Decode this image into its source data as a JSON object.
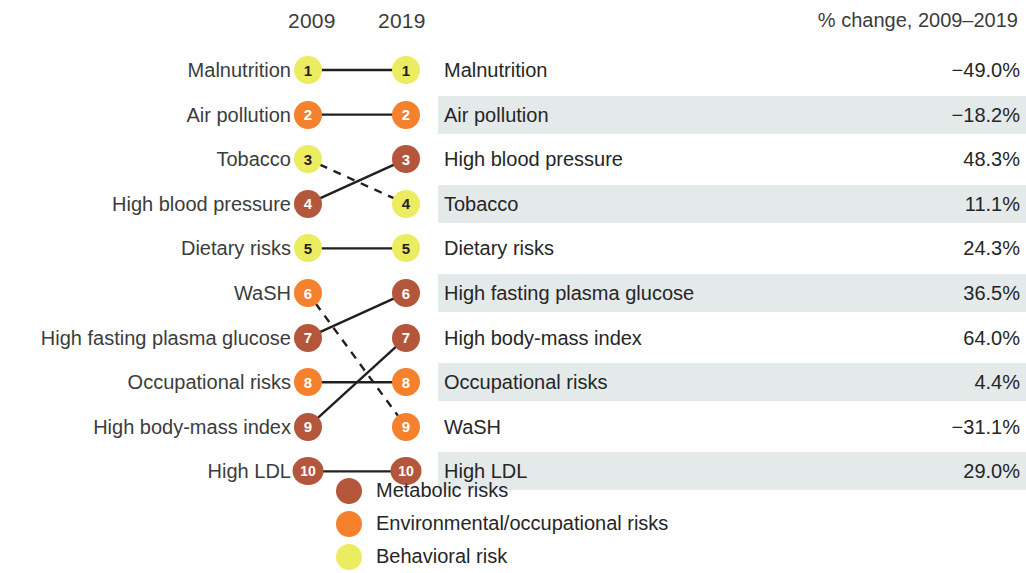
{
  "header": {
    "left_col": "2009",
    "right_col": "2019",
    "pct_col": "% change, 2009–2019"
  },
  "colors": {
    "metabolic": "#b4563c",
    "environmental": "#f5812c",
    "behavioral": "#ecec60",
    "band": "#e4e9e9",
    "link": "#231f20",
    "text": "#3c3c3c"
  },
  "chart_data": {
    "type": "slope",
    "title": "",
    "xlabel": "",
    "ylabel": "",
    "categories": [
      "2009",
      "2019"
    ],
    "left_ranks": [
      {
        "rank": 1,
        "label": "Malnutrition",
        "category": "behavioral"
      },
      {
        "rank": 2,
        "label": "Air pollution",
        "category": "environmental"
      },
      {
        "rank": 3,
        "label": "Tobacco",
        "category": "behavioral"
      },
      {
        "rank": 4,
        "label": "High blood pressure",
        "category": "metabolic"
      },
      {
        "rank": 5,
        "label": "Dietary risks",
        "category": "behavioral"
      },
      {
        "rank": 6,
        "label": "WaSH",
        "category": "environmental"
      },
      {
        "rank": 7,
        "label": "High fasting plasma glucose",
        "category": "metabolic"
      },
      {
        "rank": 8,
        "label": "Occupational risks",
        "category": "environmental"
      },
      {
        "rank": 9,
        "label": "High body-mass index",
        "category": "metabolic"
      },
      {
        "rank": 10,
        "label": "High LDL",
        "category": "metabolic"
      }
    ],
    "right_ranks": [
      {
        "rank": 1,
        "label": "Malnutrition",
        "category": "behavioral"
      },
      {
        "rank": 2,
        "label": "Air pollution",
        "category": "environmental"
      },
      {
        "rank": 3,
        "label": "High blood pressure",
        "category": "metabolic"
      },
      {
        "rank": 4,
        "label": "Tobacco",
        "category": "behavioral"
      },
      {
        "rank": 5,
        "label": "Dietary risks",
        "category": "behavioral"
      },
      {
        "rank": 6,
        "label": "High fasting plasma glucose",
        "category": "metabolic"
      },
      {
        "rank": 7,
        "label": "High body-mass index",
        "category": "metabolic"
      },
      {
        "rank": 8,
        "label": "Occupational risks",
        "category": "environmental"
      },
      {
        "rank": 9,
        "label": "WaSH",
        "category": "environmental"
      },
      {
        "rank": 10,
        "label": "High LDL",
        "category": "metabolic"
      }
    ],
    "links": [
      {
        "from": 1,
        "to": 1,
        "style": "solid"
      },
      {
        "from": 2,
        "to": 2,
        "style": "solid"
      },
      {
        "from": 3,
        "to": 4,
        "style": "dashed"
      },
      {
        "from": 4,
        "to": 3,
        "style": "solid"
      },
      {
        "from": 5,
        "to": 5,
        "style": "solid"
      },
      {
        "from": 6,
        "to": 9,
        "style": "dashed"
      },
      {
        "from": 7,
        "to": 6,
        "style": "solid"
      },
      {
        "from": 8,
        "to": 8,
        "style": "solid"
      },
      {
        "from": 9,
        "to": 7,
        "style": "solid"
      },
      {
        "from": 10,
        "to": 10,
        "style": "solid"
      }
    ],
    "pct_change": [
      {
        "label": "Malnutrition",
        "value": "−49.0%",
        "shaded": false
      },
      {
        "label": "Air pollution",
        "value": "−18.2%",
        "shaded": true
      },
      {
        "label": "High blood pressure",
        "value": "48.3%",
        "shaded": false
      },
      {
        "label": "Tobacco",
        "value": "11.1%",
        "shaded": true
      },
      {
        "label": "Dietary risks",
        "value": "24.3%",
        "shaded": false
      },
      {
        "label": "High fasting plasma glucose",
        "value": "36.5%",
        "shaded": true
      },
      {
        "label": "High body-mass index",
        "value": "64.0%",
        "shaded": false
      },
      {
        "label": "Occupational risks",
        "value": "4.4%",
        "shaded": true
      },
      {
        "label": "WaSH",
        "value": "−31.1%",
        "shaded": false
      },
      {
        "label": "High LDL",
        "value": "29.0%",
        "shaded": true
      }
    ]
  },
  "legend": {
    "items": [
      {
        "label": "Metabolic risks",
        "color_key": "metabolic"
      },
      {
        "label": "Environmental/occupational risks",
        "color_key": "environmental"
      },
      {
        "label": "Behavioral risk",
        "color_key": "behavioral"
      }
    ]
  }
}
